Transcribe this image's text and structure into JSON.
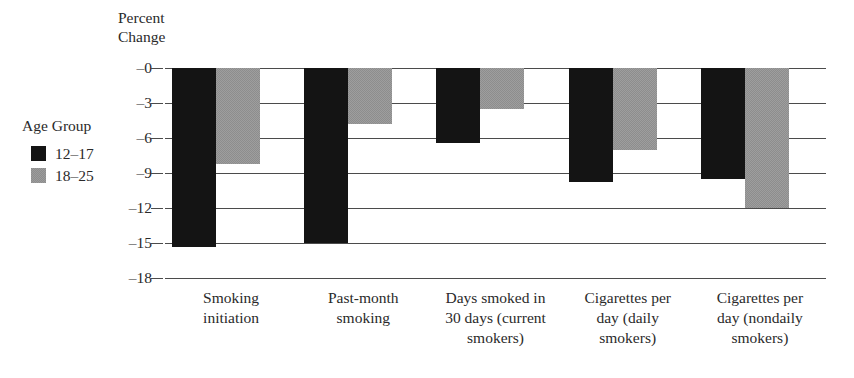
{
  "chart_data": {
    "type": "bar",
    "title": "",
    "subtitle": "",
    "xlabel": "",
    "ylabel": "Percent\nChange",
    "ylim": [
      -18,
      0
    ],
    "yticks": [
      "–0",
      "–3",
      "–6",
      "–9",
      "–12",
      "–15",
      "–18"
    ],
    "ytick_values": [
      0,
      -3,
      -6,
      -9,
      -12,
      -15,
      -18
    ],
    "grid": true,
    "legend_position": "left",
    "legend_title": "Age Group",
    "categories": [
      "Smoking\ninitiation",
      "Past-month\nsmoking",
      "Days smoked in\n30 days (current\nsmokers)",
      "Cigarettes per\nday (daily\nsmokers)",
      "Cigarettes per\nday (nondaily\nsmokers)"
    ],
    "series": [
      {
        "name": "12–17",
        "color": "#141414",
        "values": [
          -15.3,
          -15.0,
          -6.4,
          -9.8,
          -9.5
        ]
      },
      {
        "name": "18–25",
        "color": "#8d8d8d",
        "values": [
          -8.2,
          -4.8,
          -3.5,
          -7.0,
          -12.0
        ]
      }
    ]
  },
  "axis": {
    "title": "Percent\nChange"
  },
  "legend": {
    "title": "Age Group",
    "entries": [
      {
        "label": "12–17",
        "swatch": "dark"
      },
      {
        "label": "18–25",
        "swatch": "light"
      }
    ]
  }
}
